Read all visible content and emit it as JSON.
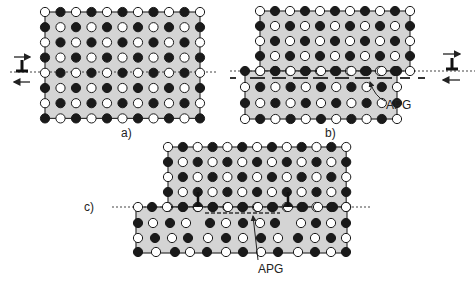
{
  "figure": {
    "colors": {
      "background": "#ffffff",
      "block_fill": "#d4d4d4",
      "block_stroke": "#333333",
      "atom_dark": "#1a1a1a",
      "atom_light": "#ffffff",
      "atom_stroke": "#1a1a1a",
      "dotted_line": "#444444",
      "dash_line": "#333333"
    },
    "panels": [
      {
        "id": "a",
        "label": "a)",
        "label_pos": [
          126,
          128
        ],
        "blocks": [
          {
            "x0": 45,
            "y0": 12,
            "dx": 15.5,
            "dy": 15.2,
            "cols": 11,
            "rows": 8,
            "start_dark": false
          }
        ],
        "slip_line": {
          "y": 72,
          "x1": 10,
          "x2": 218
        },
        "dislocation": {
          "x": 22,
          "y": 72,
          "arrow_top_y": 57,
          "arrow_bottom_y": 82,
          "arrow_x1": 14,
          "arrow_x2": 30
        }
      },
      {
        "id": "b",
        "label": "b)",
        "label_pos": [
          330,
          128
        ],
        "blocks": [
          {
            "x0": 260,
            "y0": 11,
            "dx": 15.0,
            "dy": 15.0,
            "cols": 11,
            "rows": 5,
            "start_dark": false
          },
          {
            "x0": 245,
            "y0": 71,
            "dx": 15.2,
            "dy": 16.0,
            "cols": 11,
            "rows": 4,
            "start_dark": true
          }
        ],
        "slip_line": {
          "y": 71,
          "x1": 230,
          "x2": 475
        },
        "dashes": {
          "y": 78,
          "segments": [
            [
              230,
              236
            ],
            [
              250,
              265
            ],
            [
              272,
              286
            ],
            [
              293,
              308
            ],
            [
              313,
              328
            ],
            [
              335,
              349
            ],
            [
              355,
              370
            ],
            [
              377,
              392
            ],
            [
              400,
              410
            ],
            [
              418,
              425
            ]
          ]
        },
        "dislocation": {
          "x": 452,
          "y": 70,
          "arrow_top_y": 54,
          "arrow_bottom_y": 80,
          "arrow_x1": 443,
          "arrow_x2": 460
        },
        "apg": {
          "label": "APG",
          "text_pos": [
            386,
            106
          ],
          "arrow_from": [
            385,
            101
          ],
          "arrow_to": [
            370,
            82
          ]
        }
      },
      {
        "id": "c",
        "label": "c)",
        "label_pos": [
          88,
          205
        ],
        "blocks": [
          {
            "x0": 168,
            "y0": 147,
            "dx": 14.85,
            "dy": 15.0,
            "cols": 13,
            "rows": 5,
            "start_dark": false
          }
        ],
        "lower_block": {
          "outline": [
            136,
            207,
            347,
            253
          ],
          "rows": [
            {
              "y": 207,
              "xs": [
                138,
                152,
                167,
                183,
                198,
                213,
                228,
                243,
                258,
                273,
                288,
                303,
                318,
                333,
                346
              ],
              "start_dark": false,
              "half": [
                198,
                288
              ]
            },
            {
              "y": 223,
              "xs": [
                138,
                153,
                170,
                186,
                210,
                226,
                243,
                260,
                275,
                301,
                316,
                331,
                346
              ],
              "pattern": [
                "d",
                "l",
                "d",
                "l",
                "d",
                "l",
                "d",
                "l",
                "d",
                "l",
                "d",
                "l",
                "d"
              ]
            },
            {
              "y": 238,
              "xs": [
                138,
                155,
                172,
                188,
                208,
                226,
                243,
                261,
                278,
                298,
                315,
                331,
                346
              ],
              "pattern": [
                "l",
                "d",
                "l",
                "d",
                "l",
                "d",
                "l",
                "d",
                "l",
                "d",
                "l",
                "d",
                "l"
              ]
            },
            {
              "y": 252,
              "xs": [
                138,
                156,
                175,
                190,
                207,
                226,
                243,
                261,
                278,
                298,
                315,
                331,
                346
              ],
              "pattern": [
                "d",
                "l",
                "d",
                "l",
                "d",
                "l",
                "d",
                "l",
                "d",
                "l",
                "d",
                "l",
                "d"
              ]
            }
          ]
        },
        "slip_line": {
          "y": 207,
          "x1": 112,
          "x2": 370
        },
        "bonds": [
          [
            198,
            192,
            198,
            207
          ],
          [
            288,
            192,
            288,
            207
          ]
        ],
        "dashes": {
          "y": 213,
          "segments": [
            [
              205,
              280
            ]
          ]
        },
        "apg": {
          "label": "APG",
          "text_pos": [
            260,
            272
          ],
          "arrow_from": [
            258,
            260
          ],
          "arrow_to": [
            253,
            216
          ]
        }
      }
    ]
  }
}
